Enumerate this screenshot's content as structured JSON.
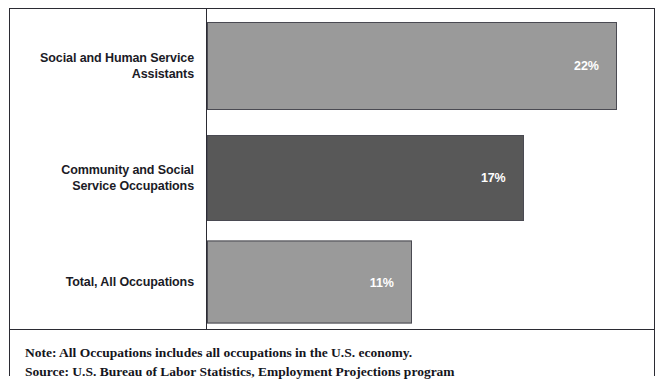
{
  "chart_data": {
    "type": "bar",
    "orientation": "horizontal",
    "title": "",
    "xlabel": "",
    "ylabel": "",
    "categories": [
      "Social and Human Service\nAssistants",
      "Community and Social\nService Occupations",
      "Total, All Occupations"
    ],
    "values": [
      22,
      17,
      11
    ],
    "value_labels": [
      "22%",
      "17%",
      "11%"
    ],
    "bar_colors": [
      "#9a9a9a",
      "#585858",
      "#9a9a9a"
    ],
    "xlim": [
      0,
      24
    ],
    "grid": false,
    "legend": null,
    "axis_ticks": []
  },
  "notes": {
    "line1": "Note: All Occupations includes all occupations in the U.S. economy.",
    "line2": "Source: U.S. Bureau of Labor Statistics, Employment Projections program"
  }
}
